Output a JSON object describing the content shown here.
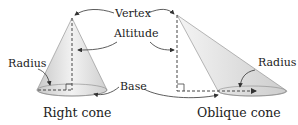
{
  "labels": {
    "vertex": "Vertex",
    "altitude": "Altitude",
    "radius_left": "Radius",
    "radius_right": "Radius",
    "base": "Base"
  },
  "captions": {
    "right_cone": "Right cone",
    "oblique_cone": "Oblique cone"
  },
  "colors": {
    "cone_fill": "#d9d9d9",
    "stroke": "#555555",
    "text": "#222222"
  }
}
